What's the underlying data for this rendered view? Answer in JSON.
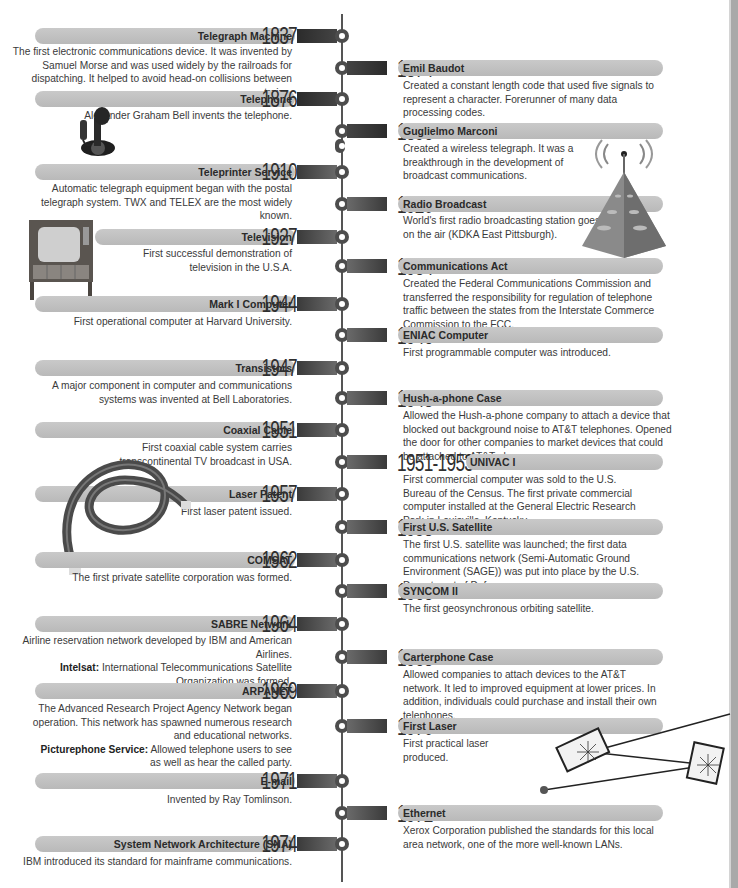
{
  "timeline": {
    "left": [
      {
        "year": "1837",
        "title": "Telegraph Machine",
        "desc": "The first electronic communications device. It was invented by Samuel Morse and was used widely by the railroads for dispatching. It helped to avoid head-on collisions between trains."
      },
      {
        "year": "1876",
        "title": "Telephone",
        "desc": "Alexander Graham Bell invents the telephone."
      },
      {
        "year": "1910",
        "title": "Teleprinter Service",
        "desc": "Automatic telegraph equipment began with the postal telegraph system. TWX and TELEX are the most widely known."
      },
      {
        "year": "1927",
        "title": "Television",
        "desc": "First successful demonstration of television in the U.S.A."
      },
      {
        "year": "1944",
        "title": "Mark I Computer",
        "desc": "First operational computer at Harvard University."
      },
      {
        "year": "1947",
        "title": "Transistors",
        "desc": "A major component in computer and communications systems was invented at Bell Laboratories."
      },
      {
        "year": "1951",
        "title": "Coaxial Cable",
        "desc": "First coaxial cable system carries transcontinental TV broadcast in USA."
      },
      {
        "year": "1957",
        "title": "Laser Patent",
        "desc": "First laser patent issued."
      },
      {
        "year": "1962",
        "title": "COMSAT",
        "desc": "The first private satellite corporation was formed."
      },
      {
        "year": "1964",
        "title": "SABRE Network",
        "desc": "Airline reservation network developed by IBM and American Airlines.",
        "extra_label": "Intelsat:",
        "extra_desc": "International Telecommunications Satellite Organization was formed."
      },
      {
        "year": "1969",
        "title": "ARPANET",
        "desc": "The Advanced Research Project Agency Network began operation. This network has spawned numerous research and educational networks.",
        "extra_label": "Picturephone Service:",
        "extra_desc": "Allowed telephone users to see as well as hear the called party."
      },
      {
        "year": "1971",
        "title": "E-mail",
        "desc": "Invented by Ray Tomlinson."
      },
      {
        "year": "1974",
        "title": "System Network Architecture (SNA)",
        "desc": "IBM introduced its standard for mainframe communications."
      }
    ],
    "right": [
      {
        "year": "1874",
        "title": "Emil Baudot",
        "desc": "Created a constant length code that used five signals to represent a character. Forerunner of many data processing codes."
      },
      {
        "year": "1896",
        "title": "Guglielmo Marconi",
        "desc": "Created a wireless telegraph. It was a breakthrough in the development of broadcast communications."
      },
      {
        "year": "1920",
        "title": "Radio Broadcast",
        "desc": "World's first radio broadcasting station goes on the air (KDKA East Pittsburgh)."
      },
      {
        "year": "1934",
        "title": "Communications Act",
        "desc": "Created the Federal Communications Commission and transferred the responsibility for regulation of telephone traffic between the states from the Interstate Commerce Commission to the FCC."
      },
      {
        "year": "1946",
        "title": "ENIAC Computer",
        "desc": "First programmable computer was introduced."
      },
      {
        "year": "1948",
        "title": "Hush-a-phone Case",
        "desc": "Allowed the Hush-a-phone company to attach a device that blocked out background noise to AT&T telephones. Opened the door for other companies to market devices that could be attached to AT&T phones."
      },
      {
        "year": "1951-1953",
        "title": "UNIVAC I",
        "desc": "First commercial computer was sold to the U.S. Bureau of the Census. The first private commercial computer installed at the General Electric Research Park in Louisville, Kentucky."
      },
      {
        "year": "1958",
        "title": "First U.S. Satellite",
        "desc": "The first U.S. satellite was launched; the first data communications network (Semi-Automatic Ground Environment (SAGE)) was put into place by the U.S. Department of Defense."
      },
      {
        "year": "1963",
        "title": "SYNCOM II",
        "desc": "The first geosynchronous orbiting satellite."
      },
      {
        "year": "1968",
        "title": "Carterphone Case",
        "desc": "Allowed companies to attach devices to the AT&T network. It led to improved equipment at lower prices. In addition, individuals could purchase and install their own telephones."
      },
      {
        "year": "1970",
        "title": "First Laser",
        "desc": "First practical laser produced."
      },
      {
        "year": "1972",
        "title": "Ethernet",
        "desc": "Xerox Corporation published the standards for this local area network, one of the more well-known LANs."
      }
    ]
  },
  "illustrations": [
    "candlestick-telephone",
    "television-set",
    "radio-tower",
    "coaxial-cable",
    "laser-mirrors"
  ],
  "colors": {
    "bar": "#c0c0c0",
    "spine": "#555555",
    "year": "#2f2f2f",
    "edge_strip": "#a9a9a9"
  }
}
